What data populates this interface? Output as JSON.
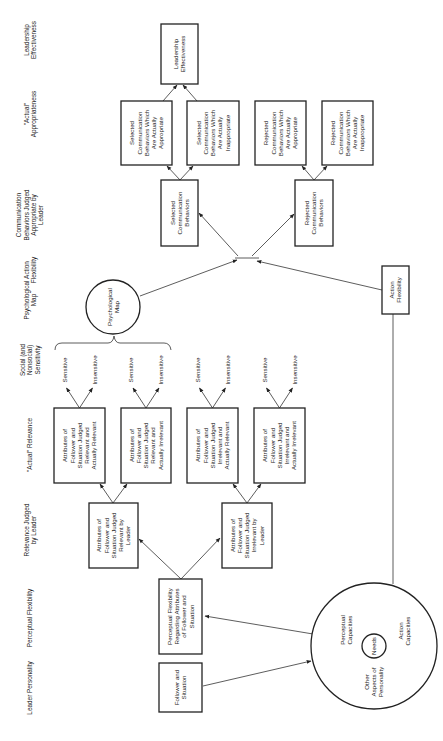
{
  "diagram": {
    "column_headers": [
      {
        "id": "leadership-effectiveness",
        "lines": [
          "Leadership",
          "Effectiveness"
        ]
      },
      {
        "id": "actual-appropriateness",
        "lines": [
          "\"Actual\"",
          "Appropriateness"
        ]
      },
      {
        "id": "comm-judged",
        "lines": [
          "Communication",
          "Behaviors Judged",
          "Appropriate by",
          "Leader"
        ]
      },
      {
        "id": "action-flexibility",
        "lines": [
          "Action",
          "Flexibility"
        ]
      },
      {
        "id": "psychological-map",
        "lines": [
          "Psychological",
          "Map"
        ]
      },
      {
        "id": "social-sensitivity",
        "lines": [
          "Social (and",
          "Nonsocial)",
          "Sensitivity"
        ]
      },
      {
        "id": "actual-relevance",
        "lines": [
          "\"Actual\" Relevance"
        ]
      },
      {
        "id": "relevance-judged",
        "lines": [
          "Relevance Judged",
          "by Leader"
        ]
      },
      {
        "id": "perceptual-flexibility",
        "lines": [
          "Perceptual Flexibility"
        ]
      },
      {
        "id": "leader-personality",
        "lines": [
          "Leader Personality"
        ]
      }
    ],
    "nodes": {
      "leadership_effectiveness": [
        "Leadership",
        "Effectiveness"
      ],
      "selected_appropriate": [
        "Selected",
        "Communication",
        "Behaviors Which",
        "Are Actually",
        "Appropriate"
      ],
      "selected_inappropriate": [
        "Selected",
        "Communication",
        "Behaviors Which",
        "Are Actually",
        "Inappropriate"
      ],
      "rejected_appropriate": [
        "Rejected",
        "Communication",
        "Behaviors Which",
        "Are Actually",
        "Appropriate"
      ],
      "rejected_inappropriate": [
        "Rejected",
        "Communication",
        "Behaviors Which",
        "Are Actually",
        "Inappropriate"
      ],
      "selected_behaviors": [
        "Selected",
        "Communication",
        "Behaviors"
      ],
      "rejected_behaviors": [
        "Rejected",
        "Communication",
        "Behaviors"
      ],
      "action_flexibility": [
        "Action",
        "Flexibility"
      ],
      "psychological_map": [
        "Psychological",
        "Map"
      ],
      "rel_rel": [
        "Attributes of",
        "Follower and",
        "Situation Judged",
        "Relevant and",
        "Actually Relevant"
      ],
      "rel_irrel": [
        "Attributes of",
        "Follower and",
        "Situation Judged",
        "Relevant and",
        "Actually Irrelevant"
      ],
      "irrel_rel": [
        "Attributes of",
        "Follower and",
        "Situation Judged",
        "Irrelevant and",
        "Actually Relevant"
      ],
      "irrel_irrel": [
        "Attributes of",
        "Follower and",
        "Situation Judged",
        "Irrelevant and",
        "Actually Irrelevant"
      ],
      "judged_relevant": [
        "Attributes of",
        "Follower and",
        "Situation Judged",
        "Relevant by",
        "Leader"
      ],
      "judged_irrelevant": [
        "Attributes of",
        "Follower and",
        "Situation Judged",
        "Irrelevant by",
        "Leader"
      ],
      "perceptual_flexibility": [
        "Perceptual Flexibility",
        "Regarding Attributes",
        "of Follower and",
        "Situation"
      ],
      "follower_situation": [
        "Follower and",
        "Situation"
      ],
      "perceptual_capacities": [
        "Perceptual",
        "Capacities"
      ],
      "action_capacities": [
        "Action",
        "Capacities"
      ],
      "other_aspects": [
        "Other",
        "Aspects of",
        "Personality"
      ],
      "needs": [
        "Needs"
      ]
    },
    "sensitivity": {
      "sensitive": "Sensitive",
      "insensitive": "Insensitive"
    }
  }
}
